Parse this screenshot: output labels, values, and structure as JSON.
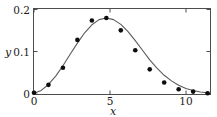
{
  "chart_data": {
    "type": "scatter",
    "title": "",
    "subtitle": "",
    "xlabel": "x",
    "ylabel": "y",
    "xlim": [
      0,
      12.2
    ],
    "ylim": [
      0,
      0.215
    ],
    "grid": false,
    "legend": null,
    "x_ticks": [
      {
        "value": 0,
        "label": "0"
      },
      {
        "value": 5,
        "label": "5"
      },
      {
        "value": 10,
        "label": "10"
      }
    ],
    "y_ticks": [
      {
        "value": 0,
        "label": "0"
      },
      {
        "value": 0.1,
        "label": "0.1"
      },
      {
        "value": 0.2,
        "label": "0.2"
      }
    ],
    "series": [
      {
        "name": "data-points",
        "marker": "filled-circle",
        "color": "#0d0d0d",
        "x": [
          0,
          1,
          2,
          3,
          4,
          5,
          6,
          7,
          8,
          9,
          10,
          11,
          12
        ],
        "values": [
          0.003,
          0.023,
          0.066,
          0.136,
          0.185,
          0.191,
          0.16,
          0.11,
          0.062,
          0.029,
          0.012,
          0.006,
          0.002
        ]
      },
      {
        "name": "fitted-curve",
        "marker": "none",
        "color": "#5a5a5a",
        "x": [
          0,
          0.5,
          1,
          1.5,
          2,
          2.5,
          3,
          3.5,
          4,
          4.5,
          5,
          5.5,
          6,
          6.5,
          7,
          7.5,
          8,
          8.5,
          9,
          9.5,
          10,
          10.5,
          11,
          11.5,
          12,
          12.2
        ],
        "values": [
          0.002,
          0.009,
          0.024,
          0.045,
          0.071,
          0.1,
          0.128,
          0.154,
          0.174,
          0.187,
          0.191,
          0.187,
          0.175,
          0.157,
          0.134,
          0.11,
          0.086,
          0.065,
          0.047,
          0.033,
          0.022,
          0.014,
          0.009,
          0.005,
          0.003,
          0.002
        ]
      }
    ]
  },
  "axes": {
    "x_axis_name": "x-axis",
    "y_axis_name": "y-axis"
  },
  "colors": {
    "frame": "#4d4d4d",
    "curve": "#5a5a5a",
    "marker": "#0d0d0d",
    "text": "#1a1a1a",
    "background": "#ffffff"
  }
}
